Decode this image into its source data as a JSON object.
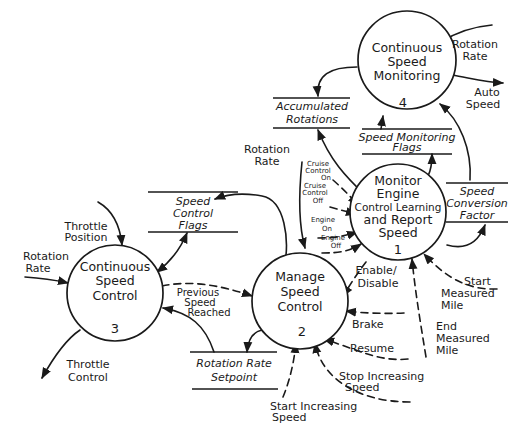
{
  "diagram": {
    "type": "data-flow-diagram",
    "processes": [
      {
        "id": "1",
        "number": "1",
        "lines": [
          "Monitor",
          "Engine",
          "Control Learning",
          "and Report",
          "Speed"
        ]
      },
      {
        "id": "2",
        "number": "2",
        "lines": [
          "Manage",
          "Speed",
          "Control"
        ]
      },
      {
        "id": "3",
        "number": "3",
        "lines": [
          "Continuous",
          "Speed",
          "Control"
        ]
      },
      {
        "id": "4",
        "number": "4",
        "lines": [
          "Continuous",
          "Speed",
          "Monitoring"
        ]
      }
    ],
    "stores": [
      {
        "id": "accumulated",
        "lines": [
          "Accumulated",
          "Rotations"
        ]
      },
      {
        "id": "speedmonflags",
        "lines": [
          "Speed Monitoring",
          "Flags"
        ]
      },
      {
        "id": "speedconv",
        "lines": [
          "Speed",
          "Conversion",
          "Factor"
        ]
      },
      {
        "id": "speedctlflags",
        "lines": [
          "Speed",
          "Control",
          "Flags"
        ]
      },
      {
        "id": "setpoint",
        "lines": [
          "Rotation Rate",
          "Setpoint"
        ]
      }
    ],
    "flows": {
      "rotation_rate_4": [
        "Rotation",
        "Rate"
      ],
      "auto_speed": [
        "Auto",
        "Speed"
      ],
      "rotation_rate_2": [
        "Rotation",
        "Rate"
      ],
      "cruise_on": [
        "Cruise",
        "Control",
        "On"
      ],
      "cruise_off": [
        "Cruise",
        "Control",
        "Off"
      ],
      "engine_on": [
        "Engine",
        "On"
      ],
      "engine_off": [
        "Engine",
        "Off"
      ],
      "enable_disable": [
        "Enable/",
        "Disable"
      ],
      "start_measured": [
        "Start",
        "Measured",
        "Mile"
      ],
      "end_measured": [
        "End",
        "Measured",
        "Mile"
      ],
      "brake": [
        "Brake"
      ],
      "resume": [
        "Resume"
      ],
      "stop_increasing": [
        "Stop Increasing",
        "Speed"
      ],
      "start_increasing": [
        "Start Increasing",
        "Speed"
      ],
      "previous_speed": [
        "Previous",
        "Speed",
        "Reached"
      ],
      "throttle_position": [
        "Throttle",
        "Position"
      ],
      "rotation_rate_3": [
        "Rotation",
        "Rate"
      ],
      "throttle_control": [
        "Throttle",
        "Control"
      ]
    }
  }
}
